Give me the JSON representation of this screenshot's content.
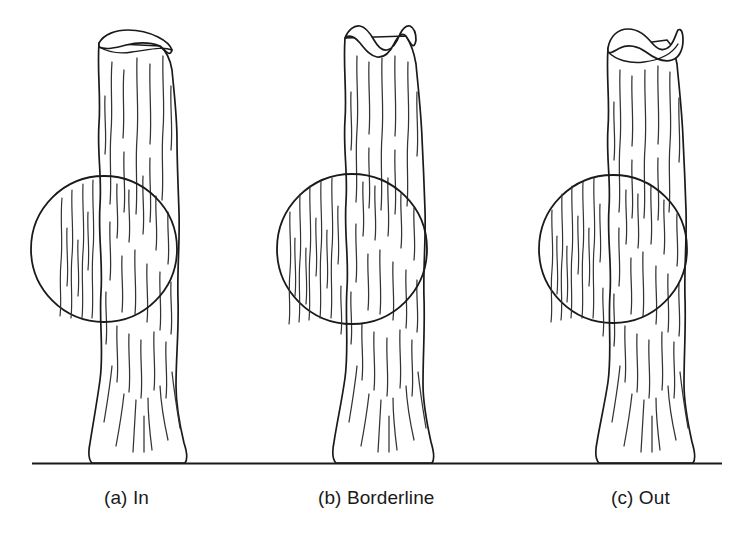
{
  "figure": {
    "background_color": "#ffffff",
    "ink_color": "#1a1a1a",
    "ground_line": {
      "name": "ground-line",
      "x_start": 32,
      "x_end": 722,
      "y": 463
    },
    "panels": [
      {
        "key": "a",
        "caption": "(a) In",
        "status": "In",
        "trunk": {
          "name": "tree-trunk",
          "top_y": 30,
          "base_y": 463,
          "top_left_x": 99,
          "top_right_x": 141,
          "mid_left_x": 100,
          "mid_right_x": 178,
          "base_left_x": 92,
          "base_right_x": 185
        },
        "circle": {
          "name": "sampling-circle",
          "center_x": 104,
          "center_y": 249,
          "radius": 73
        }
      },
      {
        "key": "b",
        "caption": "(b) Borderline",
        "status": "Borderline",
        "trunk": {
          "name": "tree-trunk",
          "top_y": 25,
          "base_y": 463,
          "top_left_x": 345,
          "top_right_x": 392,
          "mid_left_x": 344,
          "mid_right_x": 423,
          "base_left_x": 332,
          "base_right_x": 432
        },
        "circle": {
          "name": "sampling-circle",
          "center_x": 352,
          "center_y": 249,
          "radius": 75
        }
      },
      {
        "key": "c",
        "caption": "(c) Out",
        "status": "Out",
        "trunk": {
          "name": "tree-trunk",
          "top_y": 25,
          "base_y": 463,
          "top_left_x": 608,
          "top_right_x": 663,
          "mid_left_x": 607,
          "mid_right_x": 684,
          "base_left_x": 598,
          "base_right_x": 693
        },
        "circle": {
          "name": "sampling-circle",
          "center_x": 613,
          "center_y": 249,
          "radius": 74
        }
      }
    ]
  },
  "captions": {
    "a": "(a) In",
    "b": "(b) Borderline",
    "c": "(c) Out"
  }
}
